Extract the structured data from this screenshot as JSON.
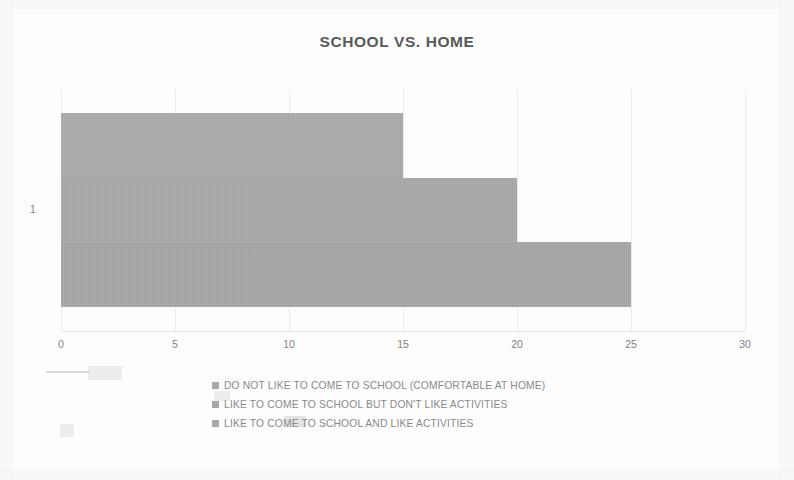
{
  "chart_data": {
    "type": "bar",
    "orientation": "horizontal",
    "title": "SCHOOL VS. HOME",
    "xlabel": "",
    "ylabel": "",
    "categories": [
      "1"
    ],
    "series": [
      {
        "name": "DO NOT LIKE TO COME TO SCHOOL (COMFORTABLE AT HOME)",
        "values": [
          15
        ],
        "color": "#ababab"
      },
      {
        "name": "LIKE TO COME TO SCHOOL BUT DON'T LIKE ACTIVITIES",
        "values": [
          20
        ],
        "color": "#a9a9a9"
      },
      {
        "name": "LIKE TO COME TO SCHOOL AND LIKE  ACTIVITIES",
        "values": [
          25
        ],
        "color": "#a7a7a7"
      }
    ],
    "xlim": [
      0,
      30
    ],
    "xticks": [
      "0",
      "5",
      "10",
      "15",
      "20",
      "25",
      "30"
    ],
    "xtick_values": [
      0,
      5,
      10,
      15,
      20,
      25,
      30
    ],
    "grid": true,
    "grid_axis": "x",
    "legend_position": "bottom"
  },
  "axis": {
    "y_category_label": "1"
  },
  "legend": {
    "items": [
      {
        "label": "DO NOT LIKE TO COME TO SCHOOL (COMFORTABLE AT HOME)",
        "marker": "square-swatch"
      },
      {
        "label": "LIKE TO COME TO SCHOOL BUT DON'T LIKE ACTIVITIES",
        "marker": "square-swatch"
      },
      {
        "label": "LIKE TO COME TO SCHOOL AND LIKE  ACTIVITIES",
        "marker": "square-swatch"
      }
    ]
  },
  "colors": {
    "bar_1": "#ababab",
    "bar_2": "#a9a9a9",
    "bar_3": "#a7a7a7",
    "title_text": "#585858",
    "axis_text": "#828282",
    "legend_text": "#8a8a8a",
    "gridline": "#ebebeb",
    "background": "#fdfdfd"
  }
}
